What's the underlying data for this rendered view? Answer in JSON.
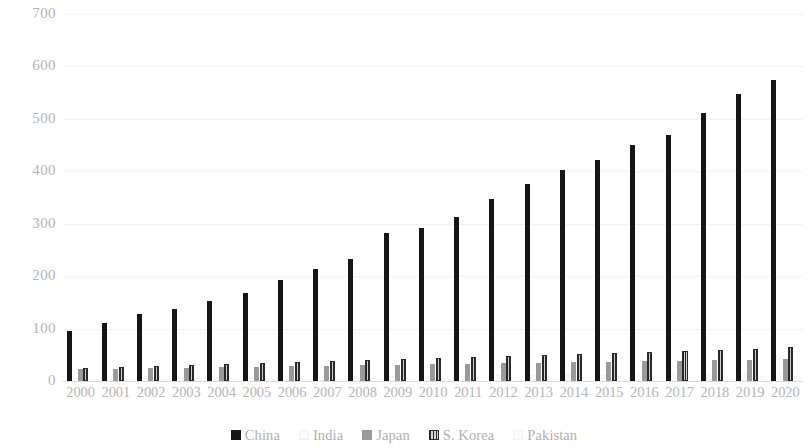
{
  "chart_data": {
    "type": "bar",
    "title": "",
    "subtitle": "",
    "xlabel": "",
    "ylabel": "",
    "ylim": [
      0,
      700
    ],
    "yticks": [
      0,
      100,
      200,
      300,
      400,
      500,
      600,
      700
    ],
    "ytick_labels": [
      "0",
      "100",
      "200",
      "300",
      "400",
      "500",
      "600",
      "700"
    ],
    "grid": true,
    "legend_position": "bottom",
    "categories": [
      "2000",
      "2001",
      "2002",
      "2003",
      "2004",
      "2005",
      "2006",
      "2007",
      "2008",
      "2009",
      "2010",
      "2011",
      "2012",
      "2013",
      "2014",
      "2015",
      "2016",
      "2017",
      "2018",
      "2019",
      "2020"
    ],
    "series": [
      {
        "name": "China",
        "color": "#161616",
        "values": [
          95,
          110,
          127,
          138,
          152,
          167,
          192,
          213,
          232,
          283,
          292,
          313,
          347,
          375,
          403,
          422,
          450,
          470,
          512,
          548,
          575
        ]
      },
      {
        "name": "India",
        "color": "#fbfbfb",
        "values": [
          3,
          3,
          4,
          4,
          5,
          5,
          6,
          6,
          7,
          7,
          8,
          8,
          9,
          9,
          10,
          10,
          11,
          11,
          12,
          12,
          13
        ]
      },
      {
        "name": "Japan",
        "color": "#9a9a9a",
        "values": [
          22,
          23,
          24,
          25,
          26,
          27,
          28,
          29,
          30,
          31,
          32,
          33,
          34,
          35,
          36,
          37,
          38,
          39,
          40,
          41,
          42
        ]
      },
      {
        "name": "S. Korea",
        "color": "#2e2e2e",
        "values": [
          24,
          26,
          28,
          30,
          32,
          34,
          36,
          38,
          40,
          42,
          43,
          45,
          47,
          49,
          51,
          53,
          55,
          57,
          60,
          62,
          65
        ]
      },
      {
        "name": "Pakistan",
        "color": "#fcfcfc",
        "values": [
          2,
          2,
          2,
          3,
          3,
          3,
          3,
          4,
          4,
          4,
          4,
          5,
          5,
          5,
          5,
          6,
          6,
          6,
          7,
          7,
          7
        ]
      }
    ]
  }
}
